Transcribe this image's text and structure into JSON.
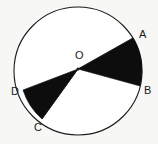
{
  "figure": {
    "type": "geometry-diagram",
    "background_color": "#f7f7f5",
    "stroke_color": "#1a1a1a",
    "fill_color": "#0d0d0d",
    "circle": {
      "name": "main-circle",
      "center_x": 78,
      "center_y": 71,
      "radius": 64,
      "stroke_width": 1.1,
      "fill": "#ffffff"
    },
    "center_point": {
      "label": "O",
      "x": 78,
      "y": 69,
      "dot_radius": 1.6,
      "label_x": 79,
      "label_y": 56
    },
    "points": [
      {
        "label": "A",
        "x": 133,
        "y": 38,
        "label_x": 139,
        "label_y": 35,
        "anchor": "start"
      },
      {
        "label": "B",
        "x": 140,
        "y": 86,
        "label_x": 144,
        "label_y": 91,
        "anchor": "start"
      },
      {
        "label": "C",
        "x": 42,
        "y": 119,
        "label_x": 34,
        "label_y": 128,
        "anchor": "start"
      },
      {
        "label": "D",
        "x": 23,
        "y": 90,
        "label_x": 12,
        "label_y": 92,
        "anchor": "start"
      }
    ],
    "sectors": [
      {
        "name": "sector-aob",
        "from": "A",
        "to": "B",
        "path": "M 78 69 L 133 38 A 64 64 0 0 1 140 86 Z",
        "fill": "#0d0d0d"
      },
      {
        "name": "sector-cod",
        "from": "D",
        "to": "C",
        "path": "M 78 69 L 23 90 A 64 64 0 0 0 42 119 Z",
        "fill": "#0d0d0d"
      }
    ]
  }
}
